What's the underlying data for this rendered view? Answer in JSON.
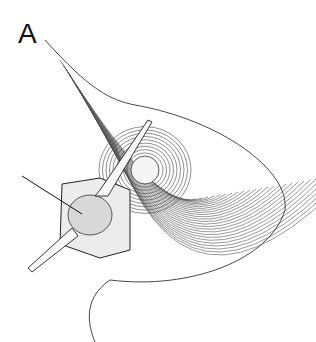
{
  "figure": {
    "panel_label": "A",
    "line_color": "#333333",
    "background": "#ffffff"
  }
}
